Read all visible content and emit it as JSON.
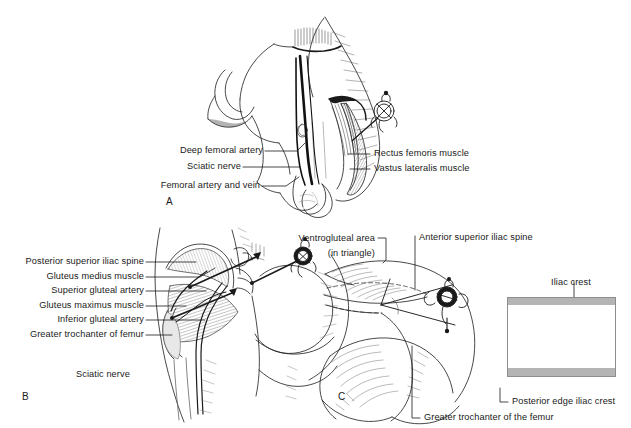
{
  "figure": {
    "background": "#ffffff",
    "ink": "#1a1a1a",
    "inset_band_color": "#b4b4b4",
    "inset_border_color": "#8d8d8d"
  },
  "panels": [
    {
      "letter": "A",
      "name": "vastus-lateralis-site",
      "labels_left": [
        {
          "text": "Deep femoral artery"
        },
        {
          "text": "Sciatic nerve"
        },
        {
          "text": "Femoral artery and vein"
        }
      ],
      "labels_right": [
        {
          "text": "Rectus femoris muscle"
        },
        {
          "text": "Vastus lateralis muscle"
        }
      ]
    },
    {
      "letter": "B",
      "name": "dorsogluteal-site",
      "labels_left": [
        {
          "text": "Posterior superior iliac spine"
        },
        {
          "text": "Gluteus medius muscle"
        },
        {
          "text": "Superior gluteal artery"
        },
        {
          "text": "Gluteus maximus muscle"
        },
        {
          "text": "Inferior gluteal artery"
        },
        {
          "text": "Greater trochanter of femur"
        }
      ],
      "labels_plain": [
        {
          "text": "Sciatic nerve"
        }
      ]
    },
    {
      "letter": "C",
      "name": "ventrogluteal-site",
      "labels": [
        {
          "text": "Ventrogluteal area"
        },
        {
          "text": "(in triangle)"
        },
        {
          "text": "Anterior superior iliac spine"
        },
        {
          "text": "Iliac crest"
        },
        {
          "text": "Posterior edge iliac crest"
        },
        {
          "text": "Greater trochanter of the femur"
        }
      ]
    }
  ]
}
